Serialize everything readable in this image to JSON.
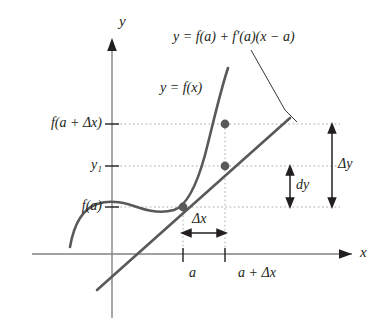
{
  "figure": {
    "type": "calculus-differential-diagram",
    "axes": {
      "x_label": "x",
      "y_label": "y"
    },
    "curve_label": "y = f(x)",
    "tangent_label": "y = f(a) + f′(a)(x − a)",
    "y_ticks": [
      {
        "label": "f(a + Δx)"
      },
      {
        "label": "y₁"
      },
      {
        "label": "f(a)"
      }
    ],
    "x_ticks": [
      {
        "label": "a"
      },
      {
        "label": "a + Δx"
      }
    ],
    "measures": [
      {
        "label": "Δy"
      },
      {
        "label": "dy"
      },
      {
        "label": "Δx"
      }
    ],
    "colors": {
      "ink": "#231f20",
      "curve": "#58595b",
      "axis": "#808285",
      "dotted": "#a7a9ac",
      "point": "#58595b"
    }
  }
}
